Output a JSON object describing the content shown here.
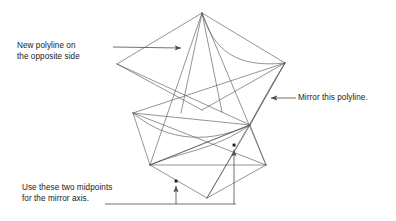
{
  "figure": {
    "background_color": "#ffffff",
    "line_color": "#4d4d4d",
    "text_color": "#1a1a1a",
    "width": 396,
    "height": 221
  },
  "callouts": [
    {
      "id": "new-polyline",
      "text": "New polyline on\nthe opposite side",
      "leader": {
        "from_x": 113,
        "from_y": 47,
        "to_x": 186,
        "to_y": 48,
        "arrow": "end"
      }
    },
    {
      "id": "mirror-polyline",
      "text": "Mirror this polyline.",
      "leader": {
        "from_x": 296,
        "from_y": 98,
        "to_x": 266,
        "to_y": 98,
        "arrow": "end"
      }
    },
    {
      "id": "midpoints",
      "text": "Use these two midpoints\nfor the mirror axis.",
      "leader": {
        "from_x": 105,
        "from_y": 204,
        "to_x": 236,
        "to_y": 204,
        "arrow": "none"
      }
    }
  ],
  "markers": [
    {
      "id": "midpoint-left",
      "x": 176,
      "y": 181,
      "label": "midpoint 1"
    },
    {
      "id": "midpoint-right",
      "x": 234,
      "y": 145,
      "label": "midpoint 2"
    }
  ],
  "geometry": {
    "description": "Two mirrored 3D star polylines drawn in wireframe isometric view",
    "vertices": {
      "top_apex": [
        202,
        13
      ],
      "upper_left": [
        117,
        64
      ],
      "upper_right": [
        285,
        63
      ],
      "upper_front": [
        202,
        110
      ],
      "mid_left": [
        133,
        113
      ],
      "mid_right": [
        250,
        125
      ],
      "lower_left": [
        150,
        165
      ],
      "lower_right": [
        266,
        165
      ],
      "bottom_apex": [
        207,
        198
      ]
    }
  }
}
